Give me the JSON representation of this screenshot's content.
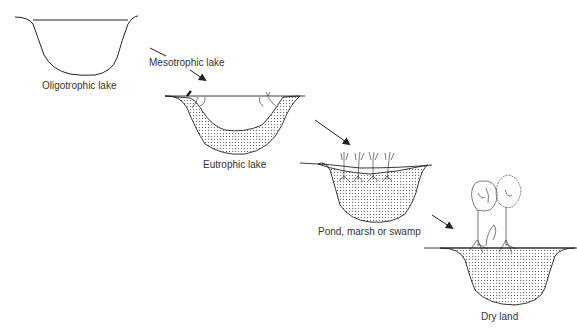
{
  "diagram": {
    "type": "lake succession sequence",
    "stages": [
      {
        "id": "oligotrophic",
        "label": "Oligotrophic lake"
      },
      {
        "id": "mesotrophic",
        "label": "Mesotrophic lake"
      },
      {
        "id": "eutrophic",
        "label": "Eutrophic lake"
      },
      {
        "id": "pond",
        "label": "Pond, marsh or swamp"
      },
      {
        "id": "dryland",
        "label": "Dry land"
      }
    ],
    "colors": {
      "line": "#222222",
      "sediment_dot": "#555555",
      "text": "#333333"
    }
  }
}
